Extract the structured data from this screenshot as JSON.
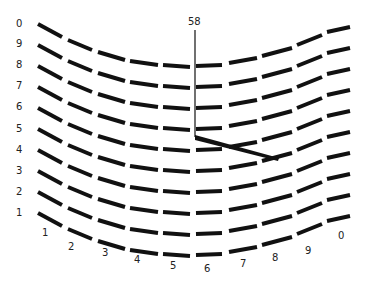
{
  "diagram": {
    "type": "vernier-arc-scale",
    "readout": "58",
    "colors": {
      "background": "#ffffff",
      "ink": "#111111",
      "label": "#222222"
    },
    "row_labels": [
      "0",
      "9",
      "8",
      "7",
      "6",
      "5",
      "4",
      "3",
      "2",
      "1"
    ],
    "bottom_labels": [
      "1",
      "2",
      "3",
      "4",
      "5",
      "6",
      "7",
      "8",
      "9",
      "0"
    ],
    "row_spacing_px": 21,
    "segments_per_row": 10,
    "pointer": {
      "vertical_line": {
        "x": 195,
        "y_top": 30,
        "y_bottom": 137
      },
      "diagonal_line": {
        "x1": 195,
        "y1": 137,
        "x2": 278,
        "y2": 160
      }
    }
  }
}
